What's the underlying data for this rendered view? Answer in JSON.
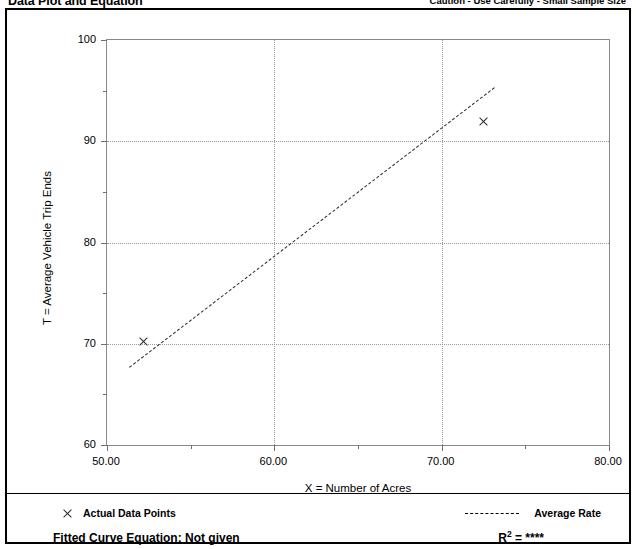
{
  "header": {
    "title": "Data Plot and Equation",
    "caution": "Caution - Use Carefully - Small Sample Size"
  },
  "legend": {
    "data_points_label": "Actual Data Points",
    "average_rate_label": "Average Rate",
    "data_point_marker": "x-marker-icon",
    "average_rate_line": "dashed-line-icon",
    "equation_label": "Fitted Curve Equation:  Not given",
    "r2_prefix": "R",
    "r2_exponent": "2",
    "r2_value": "= ****"
  },
  "chart_data": {
    "type": "scatter",
    "title": "Data Plot and Equation",
    "xlabel": "X = Number of Acres",
    "ylabel": "T = Average Vehicle Trip Ends",
    "xlim": [
      50,
      80
    ],
    "ylim": [
      60,
      100
    ],
    "xticks": [
      50,
      55,
      60,
      65,
      70,
      75,
      80
    ],
    "xtick_labels": [
      "50.00",
      "",
      "60.00",
      "",
      "70.00",
      "",
      "80.00"
    ],
    "yticks": [
      60,
      65,
      70,
      75,
      80,
      85,
      90,
      95,
      100
    ],
    "ytick_labels": [
      "60",
      "",
      "70",
      "",
      "80",
      "",
      "90",
      "",
      "100"
    ],
    "grid": true,
    "gridlines_x": [
      60,
      70
    ],
    "gridlines_y": [
      70,
      80,
      90
    ],
    "legend_position": "below-plot",
    "series": [
      {
        "name": "Actual Data Points",
        "type": "scatter",
        "marker": "x",
        "color": "#2a2a2a",
        "points": [
          {
            "x": 52.2,
            "y": 70.2
          },
          {
            "x": 72.5,
            "y": 92.0
          }
        ]
      },
      {
        "name": "Average Rate",
        "type": "line",
        "style": "dashed",
        "color": "#2a2a2a",
        "points": [
          {
            "x": 51.3,
            "y": 67.7
          },
          {
            "x": 73.1,
            "y": 95.3
          }
        ]
      }
    ]
  }
}
